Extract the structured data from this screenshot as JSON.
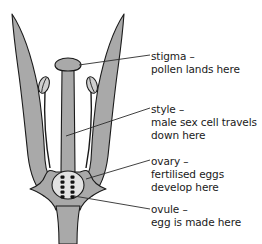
{
  "figure": {
    "width": 262,
    "height": 244,
    "background_color": "#ffffff"
  },
  "colors": {
    "petal_fill": "#a9a9a9",
    "outline": "#1a1a1a",
    "ovary_fill": "#e2e2e2",
    "ovule_fill": "#111111",
    "anther_fill": "#cfcfcf",
    "text": "#1a1a1a",
    "leader_line": "#2b2b2b"
  },
  "labels": [
    {
      "id": "stigma",
      "term": "stigma –",
      "description": "pollen lands here",
      "description_lines": [
        "pollen lands here"
      ]
    },
    {
      "id": "style",
      "term": "style –",
      "description": "male sex cell travels down here",
      "description_lines": [
        "male sex cell travels",
        "down here"
      ]
    },
    {
      "id": "ovary",
      "term": "ovary –",
      "description": "fertilised eggs develop here",
      "description_lines": [
        "fertilised eggs",
        "develop here"
      ]
    },
    {
      "id": "ovule",
      "term": "ovule –",
      "description": "egg is made here",
      "description_lines": [
        "egg is made here"
      ]
    }
  ],
  "parts": {
    "petal_left": "petal-left",
    "petal_right": "petal-right",
    "stigma": "stigma",
    "style": "style",
    "ovary": "ovary",
    "ovules": "ovules",
    "stamen_left": "stamen-left",
    "stamen_right": "stamen-right",
    "anther_left": "anther-left",
    "anther_right": "anther-right",
    "receptacle": "receptacle",
    "stem": "stem"
  },
  "ovules": {
    "columns": 2,
    "per_column": 5,
    "total": 10
  }
}
